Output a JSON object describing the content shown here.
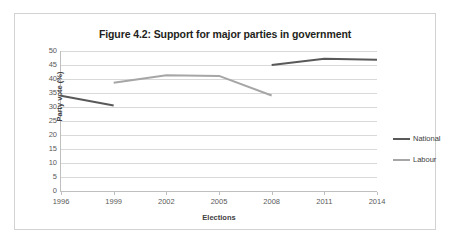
{
  "chart_data": {
    "type": "line",
    "title": "Figure 4.2: Support for major parties in government",
    "xlabel": "Elections",
    "ylabel": "Party vote (%)",
    "x": [
      1996,
      1999,
      2002,
      2005,
      2008,
      2011,
      2014
    ],
    "xtick_labels": [
      "1996",
      "1999",
      "2002",
      "2005",
      "2008",
      "2011",
      "2014"
    ],
    "ytick_labels": [
      "0",
      "5",
      "10",
      "15",
      "20",
      "25",
      "30",
      "35",
      "40",
      "45",
      "50"
    ],
    "yticks": [
      0,
      5,
      10,
      15,
      20,
      25,
      30,
      35,
      40,
      45,
      50
    ],
    "xlim": [
      1996,
      2014
    ],
    "ylim": [
      0,
      50
    ],
    "grid": "horizontal",
    "legend_position": "right",
    "series": [
      {
        "name": "National",
        "color": "#595959",
        "points": [
          {
            "x": 1996,
            "y": 34.0
          },
          {
            "x": 1999,
            "y": 30.5
          },
          {
            "x": 2008,
            "y": 45.0
          },
          {
            "x": 2011,
            "y": 47.2
          },
          {
            "x": 2014,
            "y": 46.9
          }
        ],
        "segments": [
          [
            {
              "x": 1996,
              "y": 34.0
            },
            {
              "x": 1999,
              "y": 30.5
            }
          ],
          [
            {
              "x": 2008,
              "y": 45.0
            },
            {
              "x": 2011,
              "y": 47.2
            },
            {
              "x": 2014,
              "y": 46.9
            }
          ]
        ]
      },
      {
        "name": "Labour",
        "color": "#a6a6a6",
        "points": [
          {
            "x": 1999,
            "y": 38.7
          },
          {
            "x": 2002,
            "y": 41.3
          },
          {
            "x": 2005,
            "y": 41.1
          },
          {
            "x": 2008,
            "y": 34.1
          }
        ],
        "segments": [
          [
            {
              "x": 1999,
              "y": 38.7
            },
            {
              "x": 2002,
              "y": 41.3
            },
            {
              "x": 2005,
              "y": 41.1
            },
            {
              "x": 2008,
              "y": 34.1
            }
          ]
        ]
      }
    ]
  },
  "legend": {
    "entries": [
      {
        "label": "National",
        "color": "#595959"
      },
      {
        "label": "Labour",
        "color": "#a6a6a6"
      }
    ]
  }
}
